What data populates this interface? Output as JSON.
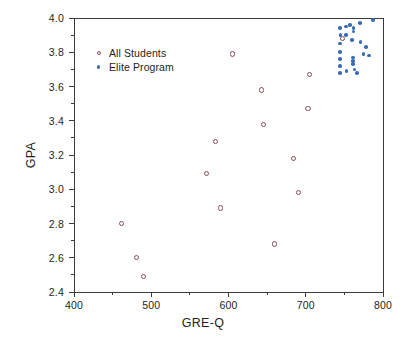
{
  "chart_data": {
    "type": "scatter",
    "title": "",
    "xlabel": "GRE-Q",
    "ylabel": "GPA",
    "xlim": [
      400,
      800
    ],
    "ylim": [
      2.4,
      4.0
    ],
    "xticks": [
      400,
      500,
      600,
      700,
      800
    ],
    "xticklabels": [
      "400",
      "500",
      "600",
      "700",
      "800"
    ],
    "yticks": [
      2.4,
      2.6,
      2.8,
      3.0,
      3.2,
      3.4,
      3.6,
      3.8,
      4.0
    ],
    "yticklabels": [
      "2.4",
      "2.6",
      "2.8",
      "3.0",
      "3.2",
      "3.4",
      "3.6",
      "3.8",
      "4.0"
    ],
    "xminor_ticks": [
      450,
      550,
      650,
      750
    ],
    "yminor_ticks": [
      2.5,
      2.7,
      2.9,
      3.1,
      3.3,
      3.5,
      3.7,
      3.9
    ],
    "grid": false,
    "legend_position": "upper left",
    "series": [
      {
        "name": "All Students",
        "marker": "open-circle",
        "color": "#8a4b55",
        "points": [
          {
            "x": 462,
            "y": 2.8
          },
          {
            "x": 481,
            "y": 2.6
          },
          {
            "x": 490,
            "y": 2.49
          },
          {
            "x": 572,
            "y": 3.09
          },
          {
            "x": 583,
            "y": 3.28
          },
          {
            "x": 590,
            "y": 2.89
          },
          {
            "x": 605,
            "y": 3.79
          },
          {
            "x": 643,
            "y": 3.58
          },
          {
            "x": 645,
            "y": 3.38
          },
          {
            "x": 660,
            "y": 2.68
          },
          {
            "x": 684,
            "y": 3.18
          },
          {
            "x": 691,
            "y": 2.98
          },
          {
            "x": 703,
            "y": 3.47
          },
          {
            "x": 705,
            "y": 3.67
          },
          {
            "x": 748,
            "y": 3.88
          }
        ]
      },
      {
        "name": "Elite Program",
        "marker": "filled-circle",
        "color": "#3a6cb3",
        "points": [
          {
            "x": 744,
            "y": 3.94
          },
          {
            "x": 744,
            "y": 3.85
          },
          {
            "x": 744,
            "y": 3.8
          },
          {
            "x": 744,
            "y": 3.76
          },
          {
            "x": 744,
            "y": 3.72
          },
          {
            "x": 744,
            "y": 3.68
          },
          {
            "x": 745,
            "y": 3.9
          },
          {
            "x": 752,
            "y": 3.95
          },
          {
            "x": 752,
            "y": 3.9
          },
          {
            "x": 753,
            "y": 3.69
          },
          {
            "x": 757,
            "y": 3.96
          },
          {
            "x": 760,
            "y": 3.87
          },
          {
            "x": 761,
            "y": 3.77
          },
          {
            "x": 761,
            "y": 3.75
          },
          {
            "x": 761,
            "y": 3.73
          },
          {
            "x": 762,
            "y": 3.94
          },
          {
            "x": 762,
            "y": 3.92
          },
          {
            "x": 763,
            "y": 3.7
          },
          {
            "x": 766,
            "y": 3.68
          },
          {
            "x": 770,
            "y": 3.97
          },
          {
            "x": 771,
            "y": 3.86
          },
          {
            "x": 775,
            "y": 3.79
          },
          {
            "x": 778,
            "y": 3.83
          },
          {
            "x": 782,
            "y": 3.78
          },
          {
            "x": 787,
            "y": 3.99
          }
        ]
      }
    ]
  },
  "legend": {
    "entries": [
      {
        "label": "All Students"
      },
      {
        "label": "Elite Program"
      }
    ]
  }
}
